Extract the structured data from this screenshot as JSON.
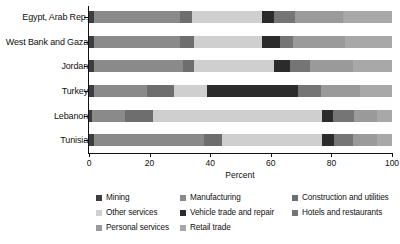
{
  "chart_data": {
    "type": "bar",
    "orientation": "horizontal",
    "stacked": true,
    "normalized": true,
    "title": "",
    "xlabel": "Percent",
    "ylabel": "",
    "xlim": [
      0,
      100
    ],
    "xticks": [
      0,
      20,
      40,
      60,
      80,
      100
    ],
    "xticklabels": [
      "0",
      "20",
      "40",
      "60",
      "80",
      "100"
    ],
    "grid": false,
    "legend_position": "bottom",
    "categories": [
      "Egypt, Arab Rep.",
      "West Bank and Gaza",
      "Jordan",
      "Turkey",
      "Lebanon",
      "Tunisia"
    ],
    "series": [
      {
        "name": "Mining",
        "color": "#3d3d3d",
        "values": [
          1.5,
          1.5,
          1.5,
          1.5,
          1.0,
          1.5
        ]
      },
      {
        "name": "Manufacturing",
        "color": "#8a8a8a",
        "values": [
          28.5,
          28.5,
          29.5,
          17.5,
          11.0,
          36.5
        ]
      },
      {
        "name": "Construction and utilities",
        "color": "#6e6e6e",
        "values": [
          4.0,
          4.5,
          3.5,
          9.0,
          9.0,
          6.0
        ]
      },
      {
        "name": "Other services",
        "color": "#cfcfcf",
        "values": [
          23.0,
          22.5,
          26.5,
          11.0,
          56.0,
          33.0
        ]
      },
      {
        "name": "Vehicle trade and repair",
        "color": "#2b2b2b",
        "values": [
          4.0,
          6.0,
          5.5,
          30.0,
          3.5,
          4.0
        ]
      },
      {
        "name": "Hotels and restaurants",
        "color": "#757575",
        "values": [
          7.0,
          4.5,
          6.5,
          7.5,
          7.0,
          6.0
        ]
      },
      {
        "name": "Personal services",
        "color": "#9a9a9a",
        "values": [
          16.0,
          17.0,
          14.0,
          13.0,
          7.5,
          8.0
        ]
      },
      {
        "name": "Retail trade",
        "color": "#a8a8a8",
        "values": [
          16.0,
          15.5,
          13.0,
          10.5,
          5.0,
          5.0
        ]
      }
    ]
  },
  "legend": {
    "items": [
      {
        "label": "Mining",
        "color": "#3d3d3d"
      },
      {
        "label": "Manufacturing",
        "color": "#8a8a8a"
      },
      {
        "label": "Construction and utilities",
        "color": "#6e6e6e"
      },
      {
        "label": "Other services",
        "color": "#cfcfcf"
      },
      {
        "label": "Vehicle trade and repair",
        "color": "#2b2b2b"
      },
      {
        "label": "Hotels and restaurants",
        "color": "#757575"
      },
      {
        "label": "Personal services",
        "color": "#9a9a9a"
      },
      {
        "label": "Retail trade",
        "color": "#a8a8a8"
      }
    ]
  }
}
